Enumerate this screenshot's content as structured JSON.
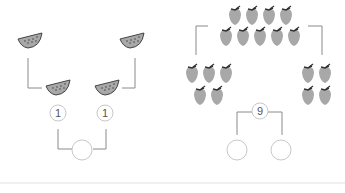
{
  "left_problem": {
    "fruit": "watermelon-slice",
    "top_items": [
      "watermelon-slice",
      "watermelon-slice"
    ],
    "bottom_items": [
      "watermelon-slice",
      "watermelon-slice"
    ],
    "part_values": [
      "1",
      "1"
    ],
    "whole_value": ""
  },
  "right_problem": {
    "fruit": "strawberry",
    "top_group_count": 9,
    "top_rows": [
      4,
      5
    ],
    "left_group_count": 5,
    "right_group_count": 4,
    "whole_value": "9",
    "part_values": [
      "",
      ""
    ]
  },
  "colors": {
    "fruit_fill": "#a8a8a8",
    "fruit_dark": "#555555",
    "line": "#8a8a8a",
    "circle_stroke": "#c8c8c8"
  }
}
